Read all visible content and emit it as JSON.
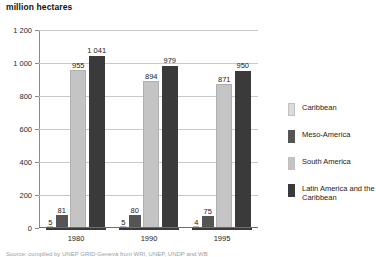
{
  "unit_title": "million hectares",
  "source_note": "Source: compiled by UNEP GRID-Geneva from WRI, UNEP, UNDP and WB",
  "legend": {
    "items": [
      {
        "label": "Caribbean",
        "color": "#dcdcdc"
      },
      {
        "label": "Meso-America",
        "color": "#555555"
      },
      {
        "label": "South America",
        "color": "#c4c4c4"
      },
      {
        "label": "Latin America and the Caribbean",
        "color": "#3a3a3a"
      }
    ]
  },
  "axis": {
    "y_ticks": [
      "0",
      "200",
      "400",
      "600",
      "800",
      "1 000",
      "1 200"
    ],
    "y_min": 0,
    "y_max": 1200,
    "x_labels": [
      "1980",
      "1990",
      "1995"
    ]
  },
  "chart_data": {
    "type": "bar",
    "title": "million hectares",
    "xlabel": "",
    "ylabel": "million hectares",
    "ylim": [
      0,
      1200
    ],
    "grid": true,
    "legend_position": "right",
    "categories": [
      "1980",
      "1990",
      "1995"
    ],
    "series": [
      {
        "name": "Caribbean",
        "color": "#dcdcdc",
        "values": [
          5,
          5,
          4
        ]
      },
      {
        "name": "Meso-America",
        "color": "#555555",
        "values": [
          81,
          80,
          75
        ]
      },
      {
        "name": "South America",
        "color": "#c4c4c4",
        "values": [
          955,
          894,
          871
        ]
      },
      {
        "name": "Latin America and the Caribbean",
        "color": "#3a3a3a",
        "values": [
          1041,
          979,
          950
        ]
      }
    ],
    "value_labels": [
      [
        "5",
        "81",
        "955",
        "1 041"
      ],
      [
        "5",
        "80",
        "894",
        "979"
      ],
      [
        "4",
        "75",
        "871",
        "950"
      ]
    ]
  }
}
